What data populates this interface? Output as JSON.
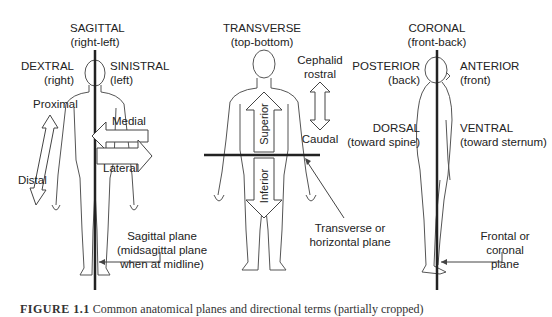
{
  "figure": {
    "panels": [
      {
        "id": "sagittal",
        "title": "SAGITTAL",
        "subtitle": "(right-left)",
        "left_term": "DEXTRAL",
        "left_sub": "(right)",
        "right_term": "SINISTRAL",
        "right_sub": "(left)",
        "arrows": {
          "proximal": "Proximal",
          "distal": "Distal",
          "medial": "Medial",
          "lateral": "Lateral"
        },
        "plane_label": [
          "Sagittal plane",
          "(midsagittal plane",
          "when at midline)"
        ]
      },
      {
        "id": "transverse",
        "title": "TRANSVERSE",
        "subtitle": "(top-bottom)",
        "arrows": {
          "superior": "Superior",
          "inferior": "Inferior",
          "cephalid": "Cephalid",
          "rostral": "rostral",
          "caudal": "Caudal"
        },
        "plane_label": [
          "Transverse or",
          "horizontal plane"
        ]
      },
      {
        "id": "coronal",
        "title": "CORONAL",
        "subtitle": "(front-back)",
        "left_term": "POSTERIOR",
        "left_sub": "(back)",
        "right_term": "ANTERIOR",
        "right_sub": "(front)",
        "left_term2": "DORSAL",
        "left_sub2": "(toward spine)",
        "right_term2": "VENTRAL",
        "right_sub2": "(toward sternum)",
        "plane_label": [
          "Frontal or",
          "coronal",
          "plane"
        ]
      }
    ],
    "caption": {
      "number": "FIGURE 1.1",
      "text": "Common anatomical planes and directional terms (partially cropped)"
    },
    "colors": {
      "line": "#222222",
      "outline": "#555555",
      "background": "#ffffff"
    }
  }
}
